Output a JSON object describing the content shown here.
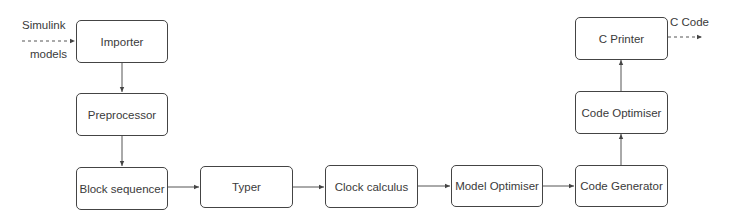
{
  "diagram": {
    "type": "compiler-pipeline-flowchart",
    "nodes": [
      {
        "id": "importer",
        "label": "Importer"
      },
      {
        "id": "preprocessor",
        "label": "Preprocessor"
      },
      {
        "id": "block_sequencer",
        "label": "Block sequencer"
      },
      {
        "id": "typer",
        "label": "Typer"
      },
      {
        "id": "clock_calculus",
        "label": "Clock calculus"
      },
      {
        "id": "model_optimiser",
        "label": "Model Optimiser"
      },
      {
        "id": "code_generator",
        "label": "Code Generator"
      },
      {
        "id": "code_optimiser",
        "label": "Code Optimiser"
      },
      {
        "id": "c_printer",
        "label": "C Printer"
      }
    ],
    "edges": [
      {
        "from": "input",
        "to": "importer",
        "style": "dashed"
      },
      {
        "from": "importer",
        "to": "preprocessor",
        "style": "solid"
      },
      {
        "from": "preprocessor",
        "to": "block_sequencer",
        "style": "solid"
      },
      {
        "from": "block_sequencer",
        "to": "typer",
        "style": "solid"
      },
      {
        "from": "typer",
        "to": "clock_calculus",
        "style": "solid"
      },
      {
        "from": "clock_calculus",
        "to": "model_optimiser",
        "style": "solid"
      },
      {
        "from": "model_optimiser",
        "to": "code_generator",
        "style": "solid"
      },
      {
        "from": "code_generator",
        "to": "code_optimiser",
        "style": "solid"
      },
      {
        "from": "code_optimiser",
        "to": "c_printer",
        "style": "solid"
      },
      {
        "from": "c_printer",
        "to": "output",
        "style": "dashed"
      }
    ],
    "input_label_top": "Simulink",
    "input_label_bottom": "models",
    "output_label": "C Code",
    "colors": {
      "stroke": "#444444",
      "text": "#3a3a3a",
      "background": "#ffffff"
    }
  }
}
